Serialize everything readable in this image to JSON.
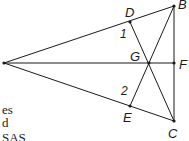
{
  "diagram": {
    "labels": {
      "B": "B",
      "C": "C",
      "D": "D",
      "E": "E",
      "F": "F",
      "G": "G",
      "angle1": "1",
      "angle2": "2"
    },
    "stroke_color": "#1a1a1a"
  },
  "text_fragments": {
    "line1": "es",
    "line2": "d",
    "line3": "SAS"
  }
}
